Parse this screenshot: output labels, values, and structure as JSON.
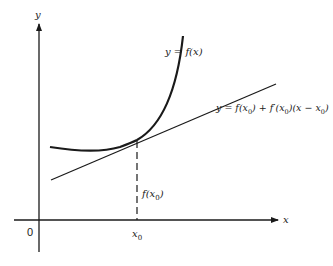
{
  "figure": {
    "axes": {
      "x_label": "x",
      "y_label": "y",
      "origin_label": "0",
      "x0_label": "x",
      "x0_sub": "0"
    },
    "curve": {
      "label": "y = f(x)"
    },
    "tangent": {
      "label_parts": [
        "y = f(x",
        "0",
        ") + f′(x",
        "0",
        ")(x − x",
        "0",
        ")"
      ]
    },
    "height_marker": {
      "label_pre": "f(x",
      "label_sub": "0",
      "label_post": ")"
    },
    "colors": {
      "ink": "#1a1a1a",
      "background": "#ffffff"
    }
  }
}
